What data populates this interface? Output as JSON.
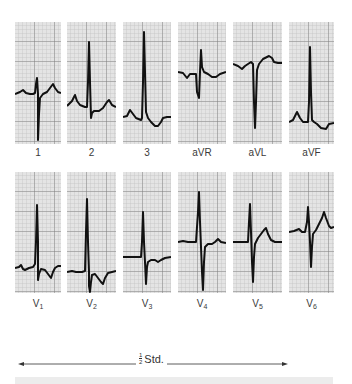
{
  "figure": {
    "rows": [
      {
        "leads": [
          {
            "label": "1",
            "sub": ""
          },
          {
            "label": "2",
            "sub": ""
          },
          {
            "label": "3",
            "sub": ""
          },
          {
            "label": "aVR",
            "sub": ""
          },
          {
            "label": "aVL",
            "sub": ""
          },
          {
            "label": "aVF",
            "sub": ""
          }
        ]
      },
      {
        "leads": [
          {
            "label": "V",
            "sub": "1"
          },
          {
            "label": "V",
            "sub": "2"
          },
          {
            "label": "V",
            "sub": "3"
          },
          {
            "label": "V",
            "sub": "4"
          },
          {
            "label": "V",
            "sub": "5"
          },
          {
            "label": "V",
            "sub": "6"
          }
        ]
      }
    ],
    "scale": {
      "numerator": "1",
      "denominator": "2",
      "label": "Std."
    },
    "colors": {
      "grid_bg": "#e4e4e4",
      "grid_minor": "#b8b8b8",
      "grid_major": "#7a7a7a",
      "trace": "#111111"
    }
  }
}
